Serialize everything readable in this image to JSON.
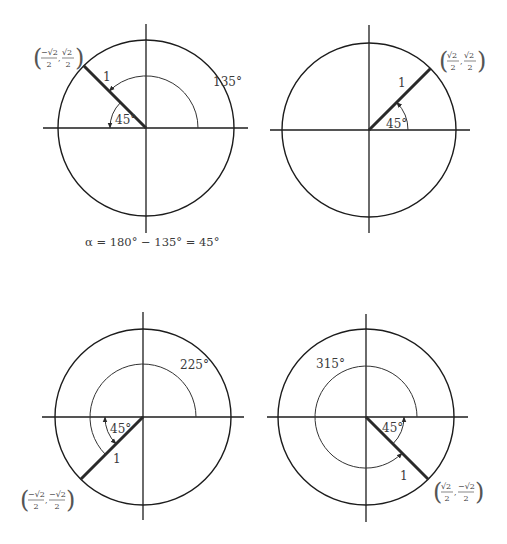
{
  "figure": {
    "colors": {
      "ink": "#1c1c1c",
      "text": "#3a3a3a",
      "background": "#ffffff"
    }
  },
  "panels": [
    {
      "id": "q2",
      "center": [
        146,
        128
      ],
      "radius": 88,
      "axis_h": [
        43,
        248
      ],
      "axis_v": [
        24,
        233
      ],
      "terminal_angle_deg": 135,
      "angle_label": "135°",
      "angle_label_pos": [
        213,
        86
      ],
      "angle_arc_radius": 52,
      "reference_label": "45°",
      "reference_label_pos": [
        115,
        124
      ],
      "reference_arc_radius": 36,
      "radius_label": "1",
      "radius_label_pos": [
        103,
        81
      ],
      "point": {
        "x_num": "−√2",
        "x_den": "2",
        "y_num": "√2",
        "y_den": "2",
        "pos": [
          33,
          44
        ]
      }
    },
    {
      "id": "q1",
      "center": [
        369,
        130
      ],
      "radius": 87,
      "axis_h": [
        270,
        470
      ],
      "axis_v": [
        25,
        233
      ],
      "terminal_angle_deg": 45,
      "angle_label": "",
      "reference_label": "45°",
      "reference_label_pos": [
        386,
        128
      ],
      "reference_arc_radius": 39,
      "radius_label": "1",
      "radius_label_pos": [
        398,
        87
      ],
      "point": {
        "x_num": "√2",
        "x_den": "2",
        "y_num": "√2",
        "y_den": "2",
        "pos": [
          439,
          47
        ]
      }
    },
    {
      "id": "q3",
      "center": [
        143,
        417
      ],
      "radius": 88,
      "axis_h": [
        42,
        244
      ],
      "axis_v": [
        312,
        520
      ],
      "terminal_angle_deg": 225,
      "angle_label": "225°",
      "angle_label_pos": [
        180,
        369
      ],
      "angle_arc_radius": 53,
      "reference_label": "45°",
      "reference_label_pos": [
        110,
        433
      ],
      "reference_arc_radius": 38,
      "radius_label": "1",
      "radius_label_pos": [
        113,
        463
      ],
      "point": {
        "x_num": "−√2",
        "x_den": "2",
        "y_num": "−√2",
        "y_den": "2",
        "pos": [
          20,
          486
        ]
      }
    },
    {
      "id": "q4",
      "center": [
        366,
        417
      ],
      "radius": 88,
      "axis_h": [
        267,
        468
      ],
      "axis_v": [
        314,
        522
      ],
      "terminal_angle_deg": 315,
      "angle_label": "315°",
      "angle_label_pos": [
        316,
        368
      ],
      "angle_arc_radius": 51,
      "reference_label": "45°",
      "reference_label_pos": [
        382,
        432
      ],
      "reference_arc_radius": 38,
      "radius_label": "1",
      "radius_label_pos": [
        400,
        480
      ],
      "point": {
        "x_num": "√2",
        "x_den": "2",
        "y_num": "−√2",
        "y_den": "2",
        "pos": [
          433,
          478
        ]
      }
    }
  ],
  "caption": {
    "text": "α = 180° − 135° = 45°",
    "pos": [
      85,
      246
    ]
  }
}
